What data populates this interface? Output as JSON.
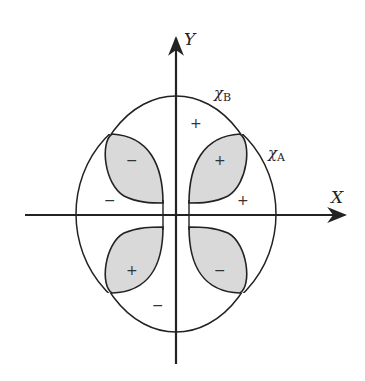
{
  "diagram": {
    "axes": {
      "x_label": "X",
      "y_label": "Y"
    },
    "curves": {
      "chi_a": {
        "symbol": "χ",
        "subscript": "A"
      },
      "chi_b": {
        "symbol": "χ",
        "subscript": "B"
      }
    },
    "lobe_signs": {
      "upper_left": "−",
      "upper_right": "+",
      "lower_left": "+",
      "lower_right": "−"
    },
    "region_signs": {
      "top": "+",
      "right": "+",
      "left": "−",
      "bottom": "−"
    },
    "colors": {
      "line": "#222222",
      "lobe_fill": "#d9d9d9",
      "background": "#ffffff"
    }
  }
}
